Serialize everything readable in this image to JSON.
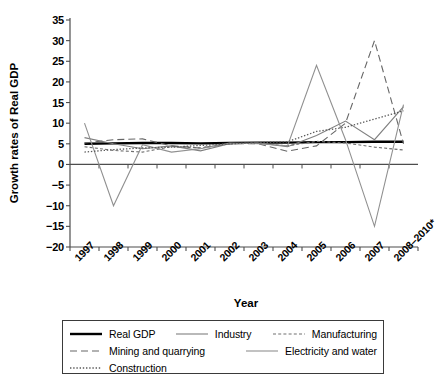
{
  "chart_data": {
    "type": "line",
    "title": "",
    "xlabel": "Year",
    "ylabel": "Growth rates of Real GDP",
    "ylim": [
      -20,
      35
    ],
    "ytick_step": 5,
    "yticks": [
      35,
      30,
      25,
      20,
      15,
      10,
      5,
      0,
      -5,
      -10,
      -15,
      -20
    ],
    "ytick_labels": [
      "35",
      "30",
      "25",
      "20",
      "15",
      "10",
      "5",
      "0",
      "−5",
      "−10",
      "−15",
      "−20"
    ],
    "grid": false,
    "legend_position": "below-plot",
    "zero_line": true,
    "categories": [
      "1997",
      "1998",
      "1999",
      "2000",
      "2001",
      "2002",
      "2003",
      "2004",
      "2005",
      "2006",
      "2007",
      "2008–2010*"
    ],
    "series": [
      {
        "name": "Real GDP",
        "style": "solid-thick-black",
        "color": "#000000",
        "values": [
          5.0,
          5.1,
          5.2,
          5.2,
          5.1,
          5.2,
          5.3,
          5.3,
          5.4,
          5.4,
          5.5,
          5.5
        ]
      },
      {
        "name": "Industry",
        "style": "solid-thin-gray",
        "color": "#808080",
        "values": [
          6.5,
          5.0,
          3.8,
          4.5,
          3.3,
          5.0,
          5.2,
          4.3,
          7.0,
          10.5,
          6.0,
          14.0
        ]
      },
      {
        "name": "Manufacturing",
        "style": "fine-dash-gray",
        "color": "#707070",
        "values": [
          4.3,
          3.4,
          3.0,
          4.3,
          4.0,
          5.0,
          5.2,
          4.5,
          5.6,
          5.2,
          4.2,
          3.5
        ]
      },
      {
        "name": "Mining and quarrying",
        "style": "long-dash-gray",
        "color": "#666666",
        "values": [
          5.2,
          6.0,
          6.2,
          4.5,
          4.0,
          5.0,
          5.0,
          3.2,
          4.5,
          10.0,
          30.0,
          5.0
        ]
      },
      {
        "name": "Electricity and water",
        "style": "solid-thin-gray",
        "color": "#909090",
        "values": [
          10.0,
          -10.0,
          4.8,
          3.0,
          3.8,
          5.2,
          5.0,
          4.5,
          24.0,
          6.0,
          -15.0,
          14.5
        ]
      },
      {
        "name": "Construction",
        "style": "dotted-gray",
        "color": "#5a5a5a",
        "values": [
          3.0,
          3.6,
          4.0,
          4.2,
          4.6,
          5.0,
          5.3,
          5.5,
          8.0,
          9.0,
          11.0,
          13.0
        ]
      }
    ]
  },
  "legend": {
    "rows": [
      [
        {
          "label": "Real GDP",
          "style": "solid-thick-black"
        },
        {
          "label": "Industry",
          "style": "solid-thin-gray"
        },
        {
          "label": "Manufacturing",
          "style": "fine-dash-gray"
        }
      ],
      [
        {
          "label": "Mining and quarrying",
          "style": "long-dash-gray"
        },
        {
          "label": "Electricity and water",
          "style": "solid-thin-gray"
        }
      ],
      [
        {
          "label": "Construction",
          "style": "dotted-gray"
        }
      ]
    ]
  },
  "colors": {
    "axis": "#4d4d4d",
    "gdp": "#000000",
    "gray": "#808080",
    "background": "#ffffff"
  }
}
